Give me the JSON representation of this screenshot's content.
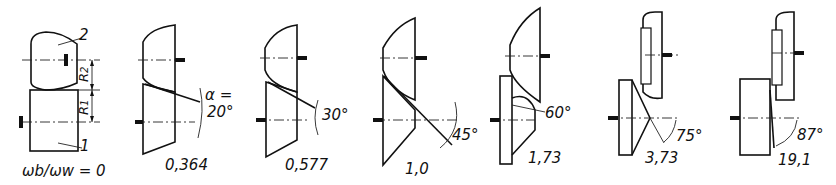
{
  "figure": {
    "type": "gear-pair contact geometry series",
    "panels": [
      {
        "id": "p0",
        "ratio_label": "ωb/ωw = 0",
        "angle_label": "",
        "part_labels": [
          "2",
          "1"
        ],
        "radius_labels": [
          "R2",
          "R1"
        ]
      },
      {
        "id": "p1",
        "ratio_label": "0,364",
        "angle_label": "α = 20°"
      },
      {
        "id": "p2",
        "ratio_label": "0,577",
        "angle_label": "30°"
      },
      {
        "id": "p3",
        "ratio_label": "1,0",
        "angle_label": "45°"
      },
      {
        "id": "p4",
        "ratio_label": "1,73",
        "angle_label": "60°"
      },
      {
        "id": "p5",
        "ratio_label": "3,73",
        "angle_label": "75°"
      },
      {
        "id": "p6",
        "ratio_label": "19,1",
        "angle_label": "87°"
      }
    ],
    "labels": {
      "part_2": "2",
      "part_1": "1",
      "r2": "R",
      "r2_sub": "2",
      "r1": "R",
      "r1_sub": "1",
      "ratio0": "ωb/ωw = 0",
      "alpha": "α =",
      "a1": "20°",
      "a2": "30°",
      "a3": "45°",
      "a4": "60°",
      "a5": "75°",
      "a6": "87°",
      "r1v": "0,364",
      "r2v": "0,577",
      "r3v": "1,0",
      "r4v": "1,73",
      "r5v": "3,73",
      "r6v": "19,1"
    }
  }
}
